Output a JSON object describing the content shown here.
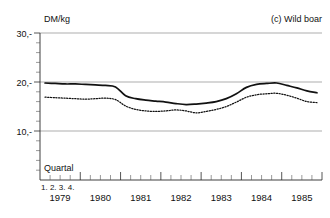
{
  "panel": {
    "title": "(c) Wild boar",
    "y_axis_unit": "DM/kg",
    "x_axis_label": "Quartal",
    "quarter_markers": "1. 2. 3. 4."
  },
  "axis": {
    "y_ticks": [
      "10,-",
      "20,-",
      "30,-"
    ],
    "y_tick_values": [
      10,
      20,
      30
    ],
    "x_year_labels": [
      "1979",
      "1980",
      "1981",
      "1982",
      "1983",
      "1984",
      "1985"
    ]
  },
  "chart_data": {
    "type": "line",
    "title": "(c) Wild boar",
    "subtitle": "",
    "xlabel": "Quartal",
    "ylabel": "DM/kg",
    "ylim": [
      0,
      30
    ],
    "grid": true,
    "gridlines_y": [
      10,
      20,
      30
    ],
    "legend_position": "none",
    "x": [
      "1979 Q1",
      "1979 Q2",
      "1979 Q3",
      "1979 Q4",
      "1980 Q1",
      "1980 Q2",
      "1980 Q3",
      "1980 Q4",
      "1981 Q1",
      "1981 Q2",
      "1981 Q3",
      "1981 Q4",
      "1982 Q1",
      "1982 Q2",
      "1982 Q3",
      "1982 Q4",
      "1983 Q1",
      "1983 Q2",
      "1983 Q3",
      "1983 Q4",
      "1984 Q1",
      "1984 Q2",
      "1984 Q3",
      "1984 Q4",
      "1985 Q1",
      "1985 Q2",
      "1985 Q3",
      "1985 Q4"
    ],
    "series": [
      {
        "name": "solid-line",
        "style": "solid",
        "color": "#111111",
        "values": [
          19.8,
          19.7,
          19.6,
          19.6,
          19.5,
          19.4,
          19.3,
          19.0,
          17.2,
          16.6,
          16.3,
          16.1,
          15.9,
          15.6,
          15.4,
          15.5,
          15.7,
          16.0,
          16.6,
          17.6,
          18.9,
          19.5,
          19.7,
          19.8,
          19.3,
          18.8,
          18.2,
          17.8
        ]
      },
      {
        "name": "dotted-line",
        "style": "dotted",
        "color": "#111111",
        "values": [
          16.9,
          16.8,
          16.7,
          16.6,
          16.5,
          16.6,
          16.7,
          16.4,
          15.1,
          14.4,
          14.1,
          14.0,
          14.1,
          14.3,
          14.1,
          13.7,
          14.0,
          14.4,
          15.0,
          15.9,
          16.9,
          17.4,
          17.6,
          17.7,
          17.3,
          16.7,
          16.0,
          15.8
        ]
      }
    ]
  }
}
